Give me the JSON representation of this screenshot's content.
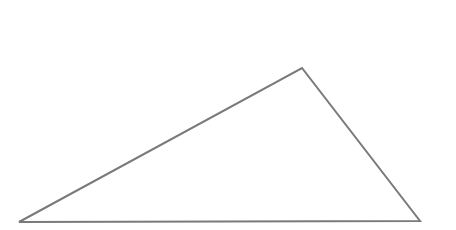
{
  "diagram": {
    "type": "triangle",
    "background": "#ffffff",
    "stroke_color": "#7a7a7a",
    "stroke_width": 2,
    "fill": "none",
    "vertices": {
      "left": {
        "x": 19,
        "y": 222
      },
      "apex": {
        "x": 302,
        "y": 68
      },
      "right": {
        "x": 420,
        "y": 221
      }
    },
    "labels": []
  }
}
